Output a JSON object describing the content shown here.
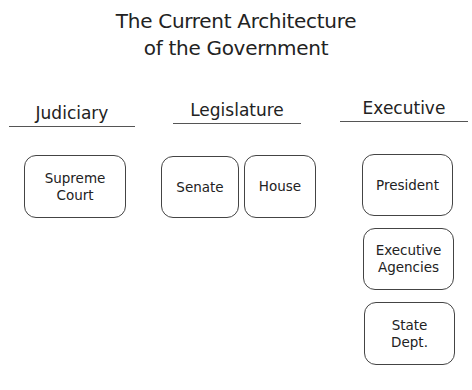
{
  "diagram": {
    "title_line1": "The Current Architecture",
    "title_line2": "of the Government",
    "branches": [
      {
        "label": "Judiciary",
        "nodes": [
          "Supreme\nCourt"
        ]
      },
      {
        "label": "Legislature",
        "nodes": [
          "Senate",
          "House"
        ]
      },
      {
        "label": "Executive",
        "nodes": [
          "President",
          "Executive\nAgencies",
          "State\nDept."
        ]
      }
    ]
  }
}
